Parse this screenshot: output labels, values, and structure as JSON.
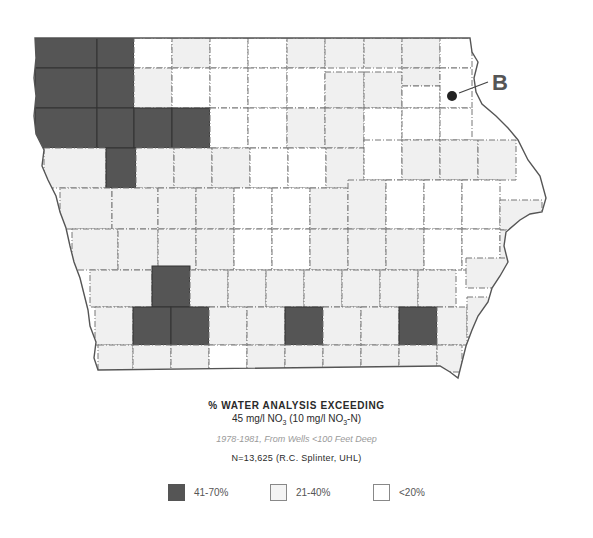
{
  "title": {
    "line1": "% WATER ANALYSIS EXCEEDING",
    "line2_prefix": "45 mg/l NO",
    "line2_sub1": "3",
    "line2_mid": " (10 mg/l NO",
    "line2_sub2": "3",
    "line2_suffix": "-N)",
    "subtitle": "1978-1981, From Wells <100 Feet Deep",
    "source": "N=13,625 (R.C. Splinter, UHL)"
  },
  "marker": {
    "label": "B"
  },
  "colors": {
    "high": "#555555",
    "medium": "#f0f0f0",
    "low": "#ffffff",
    "border": "#555555",
    "background": "#ffffff"
  },
  "legend": [
    {
      "label": "41-70%",
      "category": "high"
    },
    {
      "label": "21-40%",
      "category": "medium"
    },
    {
      "label": "<20%",
      "category": "low"
    }
  ],
  "map": {
    "region": "Iowa counties",
    "counties": [
      {
        "x": 35,
        "y": 38,
        "w": 62,
        "h": 30,
        "c": "high"
      },
      {
        "x": 97,
        "y": 38,
        "w": 37,
        "h": 30,
        "c": "high"
      },
      {
        "x": 134,
        "y": 38,
        "w": 38,
        "h": 30,
        "c": "low"
      },
      {
        "x": 172,
        "y": 38,
        "w": 38,
        "h": 30,
        "c": "medium"
      },
      {
        "x": 210,
        "y": 38,
        "w": 38,
        "h": 30,
        "c": "low"
      },
      {
        "x": 248,
        "y": 38,
        "w": 39,
        "h": 30,
        "c": "low"
      },
      {
        "x": 287,
        "y": 38,
        "w": 38,
        "h": 30,
        "c": "medium"
      },
      {
        "x": 325,
        "y": 38,
        "w": 39,
        "h": 30,
        "c": "medium"
      },
      {
        "x": 364,
        "y": 38,
        "w": 38,
        "h": 30,
        "c": "medium"
      },
      {
        "x": 402,
        "y": 38,
        "w": 38,
        "h": 30,
        "c": "medium"
      },
      {
        "x": 440,
        "y": 38,
        "w": 32,
        "h": 30,
        "c": "low"
      },
      {
        "x": 35,
        "y": 68,
        "w": 62,
        "h": 40,
        "c": "high"
      },
      {
        "x": 97,
        "y": 68,
        "w": 37,
        "h": 40,
        "c": "high"
      },
      {
        "x": 134,
        "y": 68,
        "w": 38,
        "h": 40,
        "c": "medium"
      },
      {
        "x": 172,
        "y": 68,
        "w": 38,
        "h": 40,
        "c": "low"
      },
      {
        "x": 210,
        "y": 68,
        "w": 38,
        "h": 40,
        "c": "low"
      },
      {
        "x": 248,
        "y": 68,
        "w": 39,
        "h": 40,
        "c": "low"
      },
      {
        "x": 287,
        "y": 68,
        "w": 38,
        "h": 40,
        "c": "low"
      },
      {
        "x": 325,
        "y": 72,
        "w": 39,
        "h": 36,
        "c": "medium"
      },
      {
        "x": 364,
        "y": 72,
        "w": 38,
        "h": 36,
        "c": "medium"
      },
      {
        "x": 402,
        "y": 68,
        "w": 38,
        "h": 18,
        "c": "medium"
      },
      {
        "x": 402,
        "y": 86,
        "w": 38,
        "h": 22,
        "c": "low"
      },
      {
        "x": 440,
        "y": 68,
        "w": 32,
        "h": 40,
        "c": "low"
      },
      {
        "x": 35,
        "y": 108,
        "w": 62,
        "h": 40,
        "c": "high"
      },
      {
        "x": 97,
        "y": 108,
        "w": 37,
        "h": 40,
        "c": "high"
      },
      {
        "x": 134,
        "y": 108,
        "w": 38,
        "h": 40,
        "c": "high"
      },
      {
        "x": 172,
        "y": 108,
        "w": 38,
        "h": 40,
        "c": "high"
      },
      {
        "x": 210,
        "y": 108,
        "w": 38,
        "h": 40,
        "c": "low"
      },
      {
        "x": 248,
        "y": 108,
        "w": 39,
        "h": 40,
        "c": "low"
      },
      {
        "x": 287,
        "y": 108,
        "w": 38,
        "h": 40,
        "c": "medium"
      },
      {
        "x": 325,
        "y": 108,
        "w": 39,
        "h": 40,
        "c": "medium"
      },
      {
        "x": 364,
        "y": 108,
        "w": 38,
        "h": 40,
        "c": "low"
      },
      {
        "x": 402,
        "y": 108,
        "w": 38,
        "h": 32,
        "c": "low"
      },
      {
        "x": 440,
        "y": 108,
        "w": 32,
        "h": 32,
        "c": "low"
      },
      {
        "x": 44,
        "y": 148,
        "w": 62,
        "h": 40,
        "c": "medium"
      },
      {
        "x": 106,
        "y": 148,
        "w": 30,
        "h": 40,
        "c": "high"
      },
      {
        "x": 136,
        "y": 148,
        "w": 38,
        "h": 40,
        "c": "medium"
      },
      {
        "x": 174,
        "y": 148,
        "w": 38,
        "h": 40,
        "c": "medium"
      },
      {
        "x": 212,
        "y": 148,
        "w": 38,
        "h": 40,
        "c": "medium"
      },
      {
        "x": 250,
        "y": 148,
        "w": 38,
        "h": 40,
        "c": "low"
      },
      {
        "x": 288,
        "y": 148,
        "w": 38,
        "h": 40,
        "c": "low"
      },
      {
        "x": 326,
        "y": 148,
        "w": 38,
        "h": 40,
        "c": "medium"
      },
      {
        "x": 364,
        "y": 140,
        "w": 38,
        "h": 40,
        "c": "low"
      },
      {
        "x": 402,
        "y": 140,
        "w": 38,
        "h": 40,
        "c": "medium"
      },
      {
        "x": 440,
        "y": 140,
        "w": 38,
        "h": 40,
        "c": "medium"
      },
      {
        "x": 478,
        "y": 140,
        "w": 38,
        "h": 40,
        "c": "medium"
      },
      {
        "x": 60,
        "y": 188,
        "w": 52,
        "h": 41,
        "c": "medium"
      },
      {
        "x": 112,
        "y": 188,
        "w": 46,
        "h": 41,
        "c": "medium"
      },
      {
        "x": 158,
        "y": 188,
        "w": 38,
        "h": 41,
        "c": "medium"
      },
      {
        "x": 196,
        "y": 188,
        "w": 38,
        "h": 41,
        "c": "medium"
      },
      {
        "x": 234,
        "y": 188,
        "w": 38,
        "h": 41,
        "c": "low"
      },
      {
        "x": 272,
        "y": 188,
        "w": 38,
        "h": 41,
        "c": "low"
      },
      {
        "x": 310,
        "y": 188,
        "w": 38,
        "h": 41,
        "c": "medium"
      },
      {
        "x": 348,
        "y": 180,
        "w": 38,
        "h": 49,
        "c": "medium"
      },
      {
        "x": 386,
        "y": 180,
        "w": 38,
        "h": 49,
        "c": "low"
      },
      {
        "x": 424,
        "y": 180,
        "w": 38,
        "h": 49,
        "c": "low"
      },
      {
        "x": 462,
        "y": 180,
        "w": 38,
        "h": 49,
        "c": "low"
      },
      {
        "x": 500,
        "y": 200,
        "w": 42,
        "h": 30,
        "c": "medium"
      },
      {
        "x": 72,
        "y": 229,
        "w": 46,
        "h": 41,
        "c": "medium"
      },
      {
        "x": 118,
        "y": 229,
        "w": 40,
        "h": 41,
        "c": "medium"
      },
      {
        "x": 158,
        "y": 229,
        "w": 38,
        "h": 41,
        "c": "medium"
      },
      {
        "x": 196,
        "y": 229,
        "w": 38,
        "h": 41,
        "c": "medium"
      },
      {
        "x": 234,
        "y": 229,
        "w": 38,
        "h": 41,
        "c": "low"
      },
      {
        "x": 272,
        "y": 229,
        "w": 38,
        "h": 41,
        "c": "low"
      },
      {
        "x": 310,
        "y": 229,
        "w": 38,
        "h": 41,
        "c": "medium"
      },
      {
        "x": 348,
        "y": 229,
        "w": 38,
        "h": 41,
        "c": "medium"
      },
      {
        "x": 386,
        "y": 229,
        "w": 38,
        "h": 41,
        "c": "medium"
      },
      {
        "x": 424,
        "y": 229,
        "w": 38,
        "h": 41,
        "c": "low"
      },
      {
        "x": 462,
        "y": 229,
        "w": 38,
        "h": 41,
        "c": "low"
      },
      {
        "x": 500,
        "y": 230,
        "w": 25,
        "h": 30,
        "c": "medium"
      },
      {
        "x": 90,
        "y": 270,
        "w": 62,
        "h": 37,
        "c": "medium"
      },
      {
        "x": 152,
        "y": 266,
        "w": 38,
        "h": 41,
        "c": "high"
      },
      {
        "x": 190,
        "y": 270,
        "w": 38,
        "h": 37,
        "c": "medium"
      },
      {
        "x": 228,
        "y": 270,
        "w": 38,
        "h": 37,
        "c": "medium"
      },
      {
        "x": 266,
        "y": 270,
        "w": 38,
        "h": 37,
        "c": "medium"
      },
      {
        "x": 304,
        "y": 270,
        "w": 38,
        "h": 37,
        "c": "medium"
      },
      {
        "x": 342,
        "y": 270,
        "w": 38,
        "h": 37,
        "c": "medium"
      },
      {
        "x": 380,
        "y": 270,
        "w": 38,
        "h": 37,
        "c": "medium"
      },
      {
        "x": 418,
        "y": 270,
        "w": 38,
        "h": 37,
        "c": "medium"
      },
      {
        "x": 466,
        "y": 258,
        "w": 44,
        "h": 30,
        "c": "medium"
      },
      {
        "x": 95,
        "y": 307,
        "w": 38,
        "h": 38,
        "c": "medium"
      },
      {
        "x": 133,
        "y": 307,
        "w": 38,
        "h": 38,
        "c": "high"
      },
      {
        "x": 171,
        "y": 307,
        "w": 38,
        "h": 38,
        "c": "high"
      },
      {
        "x": 209,
        "y": 307,
        "w": 38,
        "h": 38,
        "c": "medium"
      },
      {
        "x": 247,
        "y": 307,
        "w": 38,
        "h": 38,
        "c": "medium"
      },
      {
        "x": 285,
        "y": 307,
        "w": 38,
        "h": 38,
        "c": "high"
      },
      {
        "x": 323,
        "y": 307,
        "w": 38,
        "h": 38,
        "c": "medium"
      },
      {
        "x": 361,
        "y": 307,
        "w": 38,
        "h": 38,
        "c": "medium"
      },
      {
        "x": 399,
        "y": 307,
        "w": 38,
        "h": 38,
        "c": "high"
      },
      {
        "x": 437,
        "y": 307,
        "w": 30,
        "h": 38,
        "c": "medium"
      },
      {
        "x": 467,
        "y": 297,
        "w": 38,
        "h": 40,
        "c": "medium"
      },
      {
        "x": 98,
        "y": 345,
        "w": 35,
        "h": 27,
        "c": "medium"
      },
      {
        "x": 133,
        "y": 345,
        "w": 38,
        "h": 27,
        "c": "medium"
      },
      {
        "x": 171,
        "y": 345,
        "w": 38,
        "h": 27,
        "c": "medium"
      },
      {
        "x": 209,
        "y": 345,
        "w": 38,
        "h": 27,
        "c": "low"
      },
      {
        "x": 247,
        "y": 345,
        "w": 38,
        "h": 27,
        "c": "medium"
      },
      {
        "x": 285,
        "y": 345,
        "w": 38,
        "h": 27,
        "c": "medium"
      },
      {
        "x": 323,
        "y": 345,
        "w": 38,
        "h": 27,
        "c": "medium"
      },
      {
        "x": 361,
        "y": 345,
        "w": 38,
        "h": 27,
        "c": "medium"
      },
      {
        "x": 399,
        "y": 345,
        "w": 38,
        "h": 27,
        "c": "medium"
      },
      {
        "x": 437,
        "y": 345,
        "w": 25,
        "h": 27,
        "c": "medium"
      }
    ]
  }
}
